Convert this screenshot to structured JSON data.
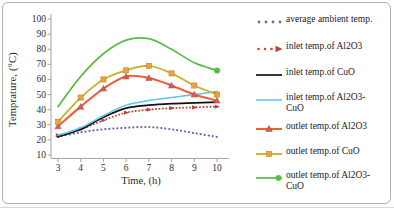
{
  "chart_data": {
    "type": "line",
    "title": "",
    "xlabel": "Time, (h)",
    "ylabel": "Temprature, (°C)",
    "x": [
      3,
      4,
      5,
      6,
      7,
      8,
      9,
      10
    ],
    "xlim": [
      3,
      10
    ],
    "ylim": [
      10,
      100
    ],
    "x_ticks": [
      3,
      4,
      5,
      6,
      7,
      8,
      9,
      10
    ],
    "y_ticks": [
      10,
      20,
      30,
      40,
      50,
      60,
      70,
      80,
      90,
      100
    ],
    "grid": false,
    "legend_position": "right",
    "axis_color": "#a3a3a3",
    "tick_label_color": "#2e2e2e",
    "series": [
      {
        "name": "average ambient temp.",
        "legend_lines": [
          "average ambient temp."
        ],
        "color": "#7467ab",
        "line_style": "dotted",
        "marker": "none",
        "values": [
          22,
          25,
          27,
          28,
          28.5,
          27,
          24.5,
          22
        ]
      },
      {
        "name": "inlet temp.of Al2O3",
        "legend_lines": [
          "inlet temp.of Al2O3"
        ],
        "color": "#be4b42",
        "line_style": "dotted",
        "marker": "arrow",
        "marker_color": "#b5443b",
        "values": [
          23,
          27,
          33,
          38,
          40,
          41,
          41.5,
          42
        ]
      },
      {
        "name": "inlet temp.of CuO",
        "legend_lines": [
          "inlet temp.of CuO"
        ],
        "color": "#111111",
        "line_style": "solid",
        "marker": "none",
        "values": [
          22,
          27,
          35,
          41,
          43,
          44,
          44.5,
          45
        ]
      },
      {
        "name": "inlet temp.of Al2O3-CuO",
        "legend_lines": [
          "inlet temp.of Al2O3-",
          "CuO"
        ],
        "color": "#5bc6ea",
        "line_style": "solid",
        "marker": "none",
        "values": [
          23,
          28,
          36,
          43,
          46,
          48,
          50,
          52
        ]
      },
      {
        "name": "outlet temp.of Al2O3",
        "legend_lines": [
          "outlet temp.of Al2O3"
        ],
        "color": "#ec5f3f",
        "line_style": "solid",
        "marker": "triangle",
        "marker_color": "#ce6553",
        "values": [
          29,
          42,
          54,
          62,
          61,
          56,
          50,
          46
        ]
      },
      {
        "name": "outlet temp.of CuO",
        "legend_lines": [
          "outlet temp.of CuO"
        ],
        "color": "#c9b32b",
        "line_style": "solid",
        "marker": "square",
        "marker_color": "#e9a33d",
        "values": [
          32,
          48,
          60,
          66,
          69,
          64,
          56,
          50
        ]
      },
      {
        "name": "outlet temp.of Al2O3-CuO",
        "legend_lines": [
          "outlet temp.of Al2O3-",
          "CuO"
        ],
        "color": "#5abb47",
        "line_style": "solid",
        "marker": "circle-end",
        "marker_color": "#5abb47",
        "values": [
          42,
          62,
          77,
          86,
          87,
          80,
          71,
          66
        ]
      }
    ]
  }
}
